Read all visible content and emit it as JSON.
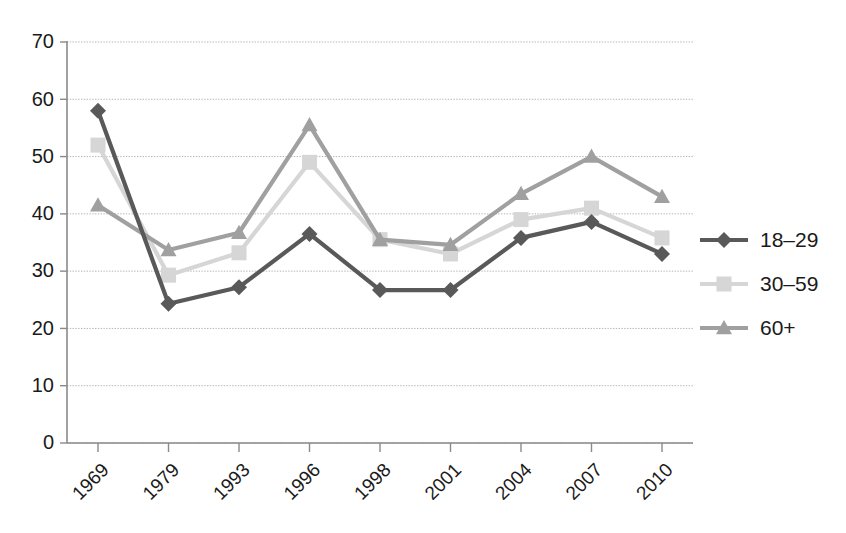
{
  "chart_data": {
    "type": "line",
    "title": "",
    "subtitle": "",
    "xlabel": "",
    "ylabel": "",
    "categories": [
      "1969",
      "1979",
      "1993",
      "1996",
      "1998",
      "2001",
      "2004",
      "2007",
      "2010"
    ],
    "ylim": [
      0,
      70
    ],
    "ytick_step": 10,
    "yticks": [
      "0",
      "10",
      "20",
      "30",
      "40",
      "50",
      "60",
      "70"
    ],
    "grid": true,
    "legend_position": "right",
    "series": [
      {
        "name": "18–29",
        "marker": "diamond",
        "color": "#595959",
        "values": [
          58,
          24.3,
          27.2,
          36.5,
          26.7,
          26.7,
          35.8,
          38.6,
          33
        ]
      },
      {
        "name": "30–59",
        "marker": "square",
        "color": "#d6d6d6",
        "values": [
          52,
          29.3,
          33.2,
          49,
          35.5,
          33,
          39,
          41,
          35.8
        ]
      },
      {
        "name": "60+",
        "marker": "triangle",
        "color": "#a0a0a0",
        "values": [
          41.5,
          33.7,
          36.7,
          55.5,
          35.5,
          34.6,
          43.5,
          50,
          43
        ]
      }
    ]
  },
  "legend": {
    "items": [
      {
        "label": "18–29"
      },
      {
        "label": "30–59"
      },
      {
        "label": "60+"
      }
    ]
  }
}
